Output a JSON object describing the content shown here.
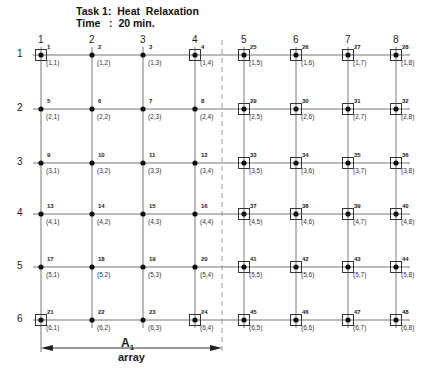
{
  "header": {
    "task": "Task 1:  Heat  Relaxation",
    "time": "Time   :  20 min."
  },
  "columns": [
    "1",
    "2",
    "3",
    "4",
    "5",
    "6",
    "7",
    "8"
  ],
  "rows": [
    "1",
    "2",
    "3",
    "4",
    "5",
    "6"
  ],
  "grid": {
    "col_x": [
      41,
      92,
      143,
      195,
      244,
      296,
      348,
      396
    ],
    "row_y": [
      55,
      109,
      163,
      214,
      267,
      320
    ],
    "boxed_nodes": [
      1,
      4,
      21,
      24,
      25,
      26,
      27,
      28,
      29,
      30,
      31,
      32,
      33,
      34,
      35,
      36,
      37,
      38,
      39,
      40,
      41,
      42,
      43,
      44,
      45,
      46,
      47,
      48
    ],
    "divider_x": 222
  },
  "nodes": [
    {
      "id": "1",
      "coord": "(1,1)"
    },
    {
      "id": "2",
      "coord": "(1,2)"
    },
    {
      "id": "3",
      "coord": "(1,3)"
    },
    {
      "id": "4",
      "coord": "(1,4)"
    },
    {
      "id": "25",
      "coord": "(1,5)"
    },
    {
      "id": "26",
      "coord": "(1,6)"
    },
    {
      "id": "27",
      "coord": "(1,7)"
    },
    {
      "id": "28",
      "coord": "(1,8)"
    },
    {
      "id": "5",
      "coord": "(2,1)"
    },
    {
      "id": "6",
      "coord": "(2,2)"
    },
    {
      "id": "7",
      "coord": "(2,3)"
    },
    {
      "id": "8",
      "coord": "(2,4)"
    },
    {
      "id": "29",
      "coord": "(2,5)"
    },
    {
      "id": "30",
      "coord": "(2,6)"
    },
    {
      "id": "31",
      "coord": "(2,7)"
    },
    {
      "id": "32",
      "coord": "(2,8)"
    },
    {
      "id": "9",
      "coord": "(3,1)"
    },
    {
      "id": "10",
      "coord": "(3,2)"
    },
    {
      "id": "11",
      "coord": "(3,3)"
    },
    {
      "id": "12",
      "coord": "(3,4)"
    },
    {
      "id": "33",
      "coord": "(3,5)"
    },
    {
      "id": "34",
      "coord": "(3,6)"
    },
    {
      "id": "35",
      "coord": "(3,7)"
    },
    {
      "id": "36",
      "coord": "(3,8)"
    },
    {
      "id": "13",
      "coord": "(4,1)"
    },
    {
      "id": "14",
      "coord": "(4,2)"
    },
    {
      "id": "15",
      "coord": "(4,3)"
    },
    {
      "id": "16",
      "coord": "(4,4)"
    },
    {
      "id": "37",
      "coord": "(4,5)"
    },
    {
      "id": "38",
      "coord": "(4,6)"
    },
    {
      "id": "39",
      "coord": "(4,7)"
    },
    {
      "id": "40",
      "coord": "(4,8)"
    },
    {
      "id": "17",
      "coord": "(5,1)"
    },
    {
      "id": "18",
      "coord": "(5,2)"
    },
    {
      "id": "19",
      "coord": "(5,3)"
    },
    {
      "id": "20",
      "coord": "(5,4)"
    },
    {
      "id": "41",
      "coord": "(5,5)"
    },
    {
      "id": "42",
      "coord": "(5,6)"
    },
    {
      "id": "43",
      "coord": "(5,7)"
    },
    {
      "id": "44",
      "coord": "(5,8)"
    },
    {
      "id": "21",
      "coord": "(6,1)"
    },
    {
      "id": "22",
      "coord": "(6,2)"
    },
    {
      "id": "23",
      "coord": "(6,3)"
    },
    {
      "id": "24",
      "coord": "(6,4)"
    },
    {
      "id": "45",
      "coord": "(6,5)"
    },
    {
      "id": "46",
      "coord": "(6,6)"
    },
    {
      "id": "47",
      "coord": "(6,7)"
    },
    {
      "id": "48",
      "coord": "(6,8)"
    }
  ],
  "array_label": {
    "name": "A",
    "subscript": "1",
    "caption": "array"
  }
}
